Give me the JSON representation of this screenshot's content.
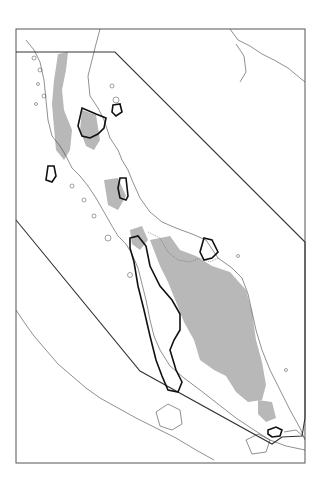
{
  "map": {
    "title": "",
    "frame": {
      "x": 16,
      "y": 29,
      "width": 289,
      "height": 434
    },
    "colors": {
      "background": "#ffffff",
      "highland_fill": "#b8b8b8",
      "coastline": "#444444",
      "study_boundary": "#333333",
      "highlighted_zones": "#111111",
      "frame": "#555555"
    },
    "layers": [
      {
        "name": "coastline",
        "description": "Outline of peninsula, islands and opposite coast"
      },
      {
        "name": "highland-areas",
        "description": "Gray shaded upland/forest regions"
      },
      {
        "name": "study-area-polygon",
        "description": "Thin dark polygon enclosing peninsula"
      },
      {
        "name": "highlighted-zones",
        "description": "Bold outlined zones"
      },
      {
        "name": "international-border",
        "description": "Dotted land border line"
      }
    ],
    "highlighted_zone_count": 7
  }
}
